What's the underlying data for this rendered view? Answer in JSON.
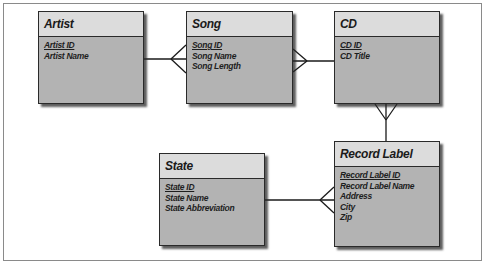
{
  "diagram": {
    "type": "entity-relationship",
    "entities": [
      {
        "id": "artist",
        "name": "Artist",
        "attributes": [
          {
            "label": "Artist ID",
            "primary_key": true
          },
          {
            "label": "Artist Name",
            "primary_key": false
          }
        ]
      },
      {
        "id": "song",
        "name": "Song",
        "attributes": [
          {
            "label": "Song ID",
            "primary_key": true
          },
          {
            "label": "Song Name",
            "primary_key": false
          },
          {
            "label": "Song Length",
            "primary_key": false
          }
        ]
      },
      {
        "id": "cd",
        "name": "CD",
        "attributes": [
          {
            "label": "CD ID",
            "primary_key": true
          },
          {
            "label": "CD Title",
            "primary_key": false
          }
        ]
      },
      {
        "id": "state",
        "name": "State",
        "attributes": [
          {
            "label": "State ID",
            "primary_key": true
          },
          {
            "label": "State Name",
            "primary_key": false
          },
          {
            "label": "State Abbreviation",
            "primary_key": false
          }
        ]
      },
      {
        "id": "record_label",
        "name": "Record Label",
        "attributes": [
          {
            "label": "Record Label ID",
            "primary_key": true
          },
          {
            "label": "Record Label Name",
            "primary_key": false
          },
          {
            "label": "Address",
            "primary_key": false
          },
          {
            "label": "City",
            "primary_key": false
          },
          {
            "label": "Zip",
            "primary_key": false
          }
        ]
      }
    ],
    "relationships": [
      {
        "from": "artist",
        "to": "song",
        "from_cardinality": "one",
        "to_cardinality": "many"
      },
      {
        "from": "song",
        "to": "cd",
        "from_cardinality": "many",
        "to_cardinality": "one"
      },
      {
        "from": "cd",
        "to": "record_label",
        "from_cardinality": "many",
        "to_cardinality": "one"
      },
      {
        "from": "state",
        "to": "record_label",
        "from_cardinality": "one",
        "to_cardinality": "many"
      }
    ]
  },
  "colors": {
    "header_fill": "#dcdcdc",
    "body_fill": "#b3b3b3",
    "border": "#2a2a2a",
    "line": "#1a1a1a"
  }
}
